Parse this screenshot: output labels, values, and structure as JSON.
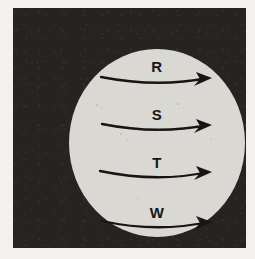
{
  "figure": {
    "plate_background_color": "#262423",
    "paper_color": "#f2f1ee",
    "disc_color": "#d9d8d3",
    "ink_color": "#161414",
    "disc": {
      "center_x": 131,
      "center_y": 127,
      "radius_x": 88,
      "radius_y": 94
    },
    "bands": [
      {
        "label": "R",
        "label_x": 131,
        "label_y": 56,
        "arrow_start_x": 75,
        "arrow_start_y": 61,
        "arrow_mid_x": 131,
        "arrow_mid_y": 70,
        "arrow_end_x": 186,
        "arrow_end_y": 62,
        "direction": "eastward"
      },
      {
        "label": "S",
        "label_x": 131,
        "label_y": 104,
        "arrow_start_x": 76,
        "arrow_start_y": 108,
        "arrow_mid_x": 131,
        "arrow_mid_y": 117,
        "arrow_end_x": 186,
        "arrow_end_y": 109,
        "direction": "eastward"
      },
      {
        "label": "T",
        "label_x": 131,
        "label_y": 152,
        "arrow_start_x": 74,
        "arrow_start_y": 155,
        "arrow_mid_x": 131,
        "arrow_mid_y": 165,
        "arrow_end_x": 186,
        "arrow_end_y": 156,
        "direction": "eastward"
      },
      {
        "label": "W",
        "label_x": 131,
        "label_y": 202,
        "arrow_start_x": 76,
        "arrow_start_y": 205,
        "arrow_mid_x": 131,
        "arrow_mid_y": 215,
        "arrow_end_x": 186,
        "arrow_end_y": 206,
        "direction": "eastward"
      }
    ]
  },
  "chart_data": {
    "type": "diagram",
    "categories": [
      "R",
      "S",
      "T",
      "W"
    ],
    "annotations": [
      "R",
      "S",
      "T",
      "W"
    ],
    "legend": [],
    "xlabel": "",
    "ylabel": ""
  }
}
